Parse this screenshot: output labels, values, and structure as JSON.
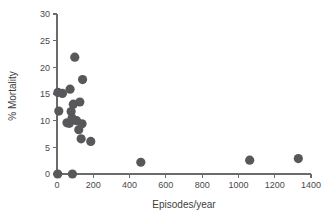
{
  "chart_data": {
    "type": "scatter",
    "title": "",
    "xlabel": "Episodes/year",
    "ylabel": "% Mortality",
    "xlim": [
      0,
      1400
    ],
    "ylim": [
      0,
      30
    ],
    "xticks": [
      0,
      200,
      400,
      600,
      800,
      1000,
      1200,
      1400
    ],
    "yticks": [
      0,
      5,
      10,
      15,
      20,
      25,
      30
    ],
    "xtick_labels": [
      "0",
      "200",
      "400",
      "600",
      "800",
      "1000",
      "1200",
      "1400"
    ],
    "ytick_labels": [
      "0",
      "5",
      "10",
      "15",
      "20",
      "25",
      "30"
    ],
    "grid": false,
    "legend": null,
    "marker": {
      "shape": "circle",
      "color": "#58585a",
      "size": 4.6
    },
    "points": [
      {
        "x": 4,
        "y": 0.0
      },
      {
        "x": 85,
        "y": 0.0
      },
      {
        "x": 5,
        "y": 15.3
      },
      {
        "x": 30,
        "y": 15.1
      },
      {
        "x": 10,
        "y": 11.8
      },
      {
        "x": 55,
        "y": 9.6
      },
      {
        "x": 68,
        "y": 9.5
      },
      {
        "x": 72,
        "y": 15.9
      },
      {
        "x": 78,
        "y": 11.7
      },
      {
        "x": 83,
        "y": 10.5
      },
      {
        "x": 90,
        "y": 13.1
      },
      {
        "x": 98,
        "y": 21.9
      },
      {
        "x": 108,
        "y": 10.0
      },
      {
        "x": 120,
        "y": 8.3
      },
      {
        "x": 126,
        "y": 13.5
      },
      {
        "x": 133,
        "y": 6.6
      },
      {
        "x": 138,
        "y": 9.4
      },
      {
        "x": 141,
        "y": 17.7
      },
      {
        "x": 186,
        "y": 6.1
      },
      {
        "x": 462,
        "y": 2.2
      },
      {
        "x": 1062,
        "y": 2.6
      },
      {
        "x": 1330,
        "y": 2.9
      }
    ]
  },
  "axes": {
    "x_title": "Episodes/year",
    "y_title": "% Mortality"
  }
}
